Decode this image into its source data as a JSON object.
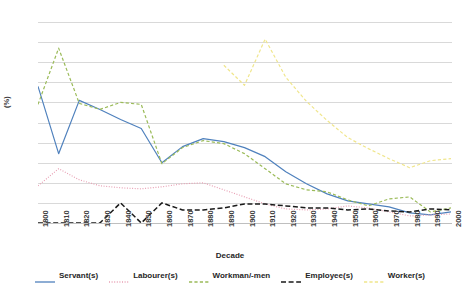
{
  "chart_data": {
    "type": "line",
    "title": "",
    "xlabel": "Decade",
    "ylabel": "(%)",
    "ylim": [
      0,
      20
    ],
    "ytick_step": 2,
    "grid": true,
    "legend_position": "bottom",
    "categories": [
      "1800",
      "1810",
      "1820",
      "1830",
      "1840",
      "1850",
      "1860",
      "1870",
      "1880",
      "1890",
      "1900",
      "1910",
      "1920",
      "1930",
      "1940",
      "1950",
      "1960",
      "1970",
      "1980",
      "1990",
      "2000"
    ],
    "yticks": [
      "0",
      "2",
      "4",
      "6",
      "8",
      "10",
      "12",
      "14",
      "16",
      "18",
      "20"
    ],
    "series": [
      {
        "name": "Servant(s)",
        "color": "#4f81bd",
        "style": "solid",
        "values": [
          13.6,
          6.9,
          12.2,
          11.3,
          10.3,
          9.4,
          6.0,
          7.6,
          8.4,
          8.1,
          7.5,
          6.6,
          5.1,
          3.9,
          2.9,
          2.2,
          1.9,
          1.6,
          1.0,
          0.8,
          1.1
        ]
      },
      {
        "name": "Labourer(s)",
        "color": "#e8a0b4",
        "style": "dotted",
        "values": [
          3.7,
          5.4,
          4.3,
          3.7,
          3.5,
          3.4,
          3.6,
          3.9,
          4.0,
          3.3,
          2.6,
          1.9,
          1.4,
          1.3,
          1.4,
          1.7,
          1.5,
          1.1,
          0.7,
          0.8,
          0.9
        ]
      },
      {
        "name": "Workman/-men",
        "color": "#9bbb59",
        "style": "dashed",
        "values": [
          11.8,
          17.4,
          11.9,
          11.3,
          12.0,
          11.8,
          5.9,
          7.5,
          8.2,
          7.9,
          6.9,
          5.4,
          3.9,
          3.3,
          3.1,
          2.3,
          1.7,
          2.4,
          2.6,
          1.1,
          1.5
        ]
      },
      {
        "name": "Employee(s)",
        "color": "#1a1a1a",
        "style": "longdash",
        "values": [
          0.0,
          0.0,
          0.0,
          0.0,
          2.0,
          0.0,
          2.0,
          1.3,
          1.3,
          1.5,
          1.9,
          1.9,
          1.7,
          1.5,
          1.5,
          1.3,
          1.4,
          1.2,
          1.1,
          1.4,
          1.3
        ]
      },
      {
        "name": "Worker(s)",
        "color": "#f0e68c",
        "style": "dashed",
        "values": [
          null,
          null,
          null,
          null,
          null,
          null,
          null,
          null,
          null,
          15.7,
          13.7,
          18.3,
          14.5,
          12.1,
          10.2,
          8.5,
          7.4,
          6.4,
          5.5,
          6.2,
          6.4
        ]
      }
    ]
  }
}
